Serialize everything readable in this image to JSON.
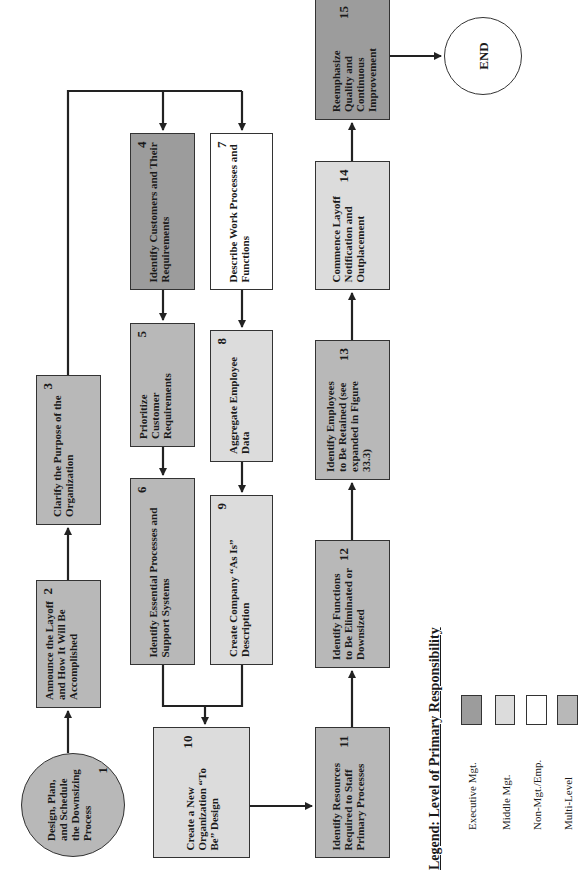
{
  "diagram": {
    "orientation": "rotated-90-ccw",
    "colors": {
      "executive": "#9c9c9c",
      "middle": "#dcdcdc",
      "non_mgt": "#ffffff",
      "multi_level": "#b8b8b8",
      "line": "#222222"
    },
    "nodes": {
      "n1": {
        "number": "1",
        "text": "Design, Plan, and Schedule the Downsizing Process",
        "level": "Multi-Level",
        "shape": "circle"
      },
      "n2": {
        "number": "2",
        "text": "Announce the Layoff and How It Will Be Accomplished",
        "level": "Multi-Level"
      },
      "n3": {
        "number": "3",
        "text": "Clarify the Purpose of the Organization",
        "level": "Multi-Level"
      },
      "n4": {
        "number": "4",
        "text": "Identify Customers and Their Requirements",
        "level": "Executive Mgt."
      },
      "n5": {
        "number": "5",
        "text": "Prioritize Customer Requirements",
        "level": "Multi-Level"
      },
      "n6": {
        "number": "6",
        "text": "Identify Essential Processes and Support Systems",
        "level": "Multi-Level"
      },
      "n7": {
        "number": "7",
        "text": "Describe Work Processes and Functions",
        "level": "Non-Mgt./Emp."
      },
      "n8": {
        "number": "8",
        "text": "Aggregate Employee Data",
        "level": "Middle Mgt."
      },
      "n9": {
        "number": "9",
        "text": "Create Company “As Is” Description",
        "level": "Middle Mgt."
      },
      "n10": {
        "number": "10",
        "text": "Create a New Organization “To Be” Design",
        "level": "Middle Mgt."
      },
      "n11": {
        "number": "11",
        "text": "Identify Resources Required to Staff Primary Processes",
        "level": "Multi-Level"
      },
      "n12": {
        "number": "12",
        "text": "Identify Functions to Be Eliminated or Downsized",
        "level": "Multi-Level"
      },
      "n13": {
        "number": "13",
        "text": "Identify Employees to Be Retained (see expanded in Figure 33.3)",
        "level": "Multi-Level"
      },
      "n14": {
        "number": "14",
        "text": "Commence Layoff Notification and Outplacement",
        "level": "Middle Mgt."
      },
      "n15": {
        "number": "15",
        "text": "Reemphasize Quality and Continuous Improvement",
        "level": "Executive Mgt."
      },
      "end": {
        "text": "END",
        "shape": "circle"
      }
    },
    "edges": [
      [
        "1",
        "2"
      ],
      [
        "2",
        "3"
      ],
      [
        "3",
        "4"
      ],
      [
        "3",
        "7"
      ],
      [
        "4",
        "5"
      ],
      [
        "5",
        "6"
      ],
      [
        "7",
        "8"
      ],
      [
        "8",
        "9"
      ],
      [
        "6",
        "10"
      ],
      [
        "9",
        "10"
      ],
      [
        "10",
        "11"
      ],
      [
        "11",
        "12"
      ],
      [
        "12",
        "13"
      ],
      [
        "13",
        "14"
      ],
      [
        "14",
        "15"
      ],
      [
        "15",
        "END"
      ]
    ],
    "legend": {
      "title": "Legend: Level of Primary Responsibility",
      "items": [
        {
          "label": "Executive Mgt.",
          "color": "#9c9c9c"
        },
        {
          "label": "Middle Mgt.",
          "color": "#dcdcdc"
        },
        {
          "label": "Non-Mgt./Emp.",
          "color": "#ffffff"
        },
        {
          "label": "Multi-Level",
          "color": "#b8b8b8"
        }
      ]
    }
  }
}
